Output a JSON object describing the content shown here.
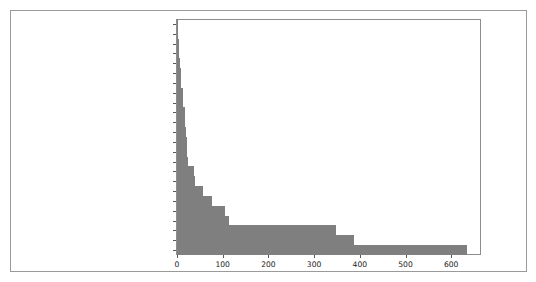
{
  "chart_data": {
    "type": "bar",
    "orientation": "horizontal",
    "title": "",
    "xlabel": "",
    "ylabel": "",
    "xlim": [
      0,
      663
    ],
    "xticks": [
      0,
      100,
      200,
      300,
      400,
      500,
      600
    ],
    "xticklabels": [
      "0",
      "100",
      "200",
      "300",
      "400",
      "500",
      "600"
    ],
    "grid": false,
    "legend": false,
    "bar_color": "#7f7f7f",
    "categories": [
      "Convention and Entertainment",
      "Mayor's Office",
      "City Controller's Office",
      "Planning & Development",
      "Houston Information Tech Svcs",
      "Finance",
      "City Council",
      "Legal Department",
      "Dept of Neighborhoods (DON)",
      "Housing and Community Devp.",
      "General Services Department",
      "Houston Emergency Center (HEC)",
      "Human Resources Dept.",
      "Municipal Courts Department",
      "Admn. & Regulatory Affairs",
      "Fleet Management Department",
      "Library",
      "Solid Waste Management",
      "Parks & Recreation",
      "Houston Airport System (HAS)",
      "Health & Human Services",
      "Public Works & Engineering-PWE",
      "Houston Fire Department (HFD)",
      "Houston Police Department-HPD"
    ],
    "values": [
      2,
      3,
      4,
      5,
      7,
      8,
      8,
      13,
      14,
      17,
      18,
      19,
      21,
      22,
      24,
      37,
      40,
      57,
      76,
      104,
      113,
      348,
      388,
      635
    ]
  }
}
